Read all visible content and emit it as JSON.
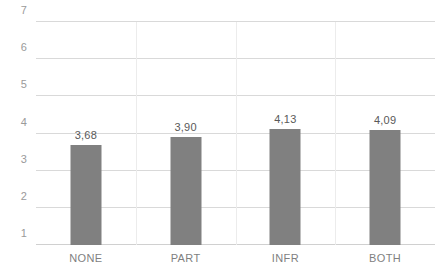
{
  "chart_data": {
    "type": "bar",
    "title": "",
    "subtitle": "",
    "xlabel": "",
    "ylabel": "",
    "categories": [
      "NONE",
      "PART",
      "INFR",
      "BOTH"
    ],
    "values": [
      3.68,
      3.9,
      4.13,
      4.09
    ],
    "value_labels": [
      "3,68",
      "3,90",
      "4,13",
      "4,09"
    ],
    "ylim": [
      1,
      7
    ],
    "yticks": [
      1,
      2,
      3,
      4,
      5,
      6,
      7
    ],
    "ytick_labels": [
      "1",
      "2",
      "3",
      "4",
      "5",
      "6",
      "7"
    ],
    "grid": "horizontal",
    "legend": "none",
    "decimal_separator": ",",
    "series": [
      {
        "name": "",
        "color": "#808080",
        "values": [
          3.68,
          3.9,
          4.13,
          4.09
        ]
      }
    ]
  },
  "style": {
    "bar_color": "#808080",
    "gridline_color": "#d9d9d9",
    "axis_text_color": "#9a9a9a",
    "category_text_color": "#7f7f7f",
    "data_label_color": "#595959",
    "background": "#ffffff"
  }
}
